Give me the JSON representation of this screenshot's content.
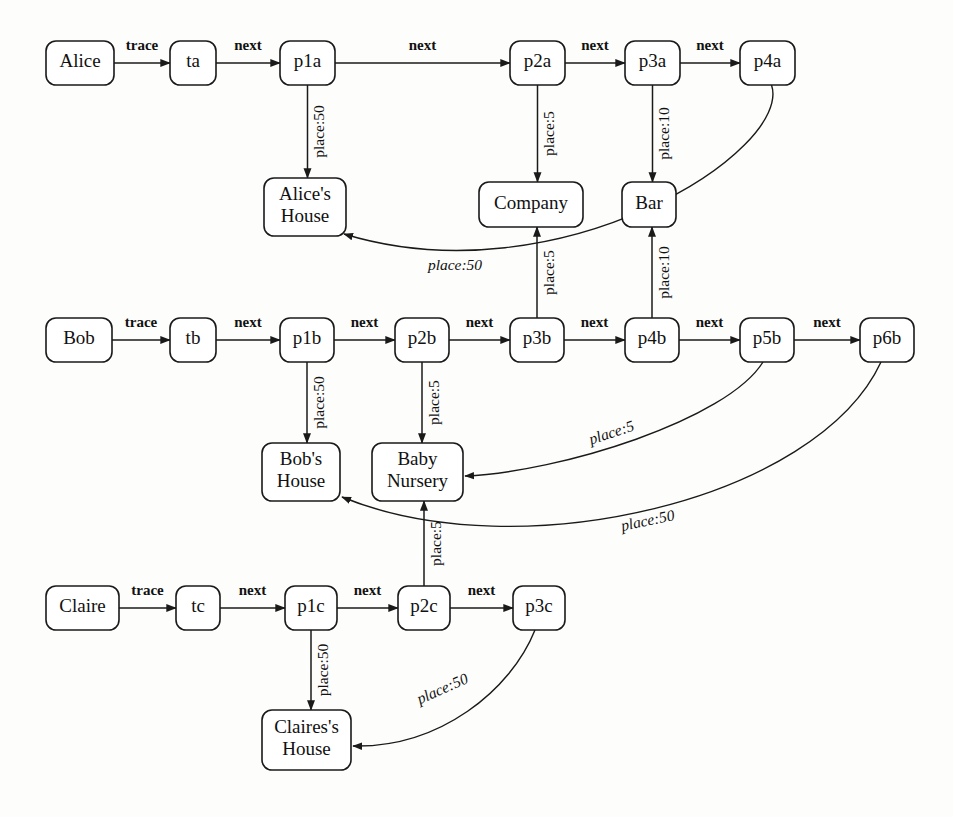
{
  "diagram": {
    "type": "directed-graph",
    "background_color": "#fdfdfb",
    "node_fill": "#ffffff",
    "stroke_color": "#1a1a1a",
    "nodes": [
      {
        "id": "alice",
        "label": "Alice",
        "x": 46,
        "y": 41,
        "w": 68,
        "h": 44,
        "lines": [
          "Alice"
        ]
      },
      {
        "id": "ta",
        "label": "ta",
        "x": 170,
        "y": 41,
        "w": 46,
        "h": 44,
        "lines": [
          "ta"
        ]
      },
      {
        "id": "p1a",
        "label": "p1a",
        "x": 280,
        "y": 41,
        "w": 55,
        "h": 44,
        "lines": [
          "p1a"
        ]
      },
      {
        "id": "p2a",
        "label": "p2a",
        "x": 510,
        "y": 41,
        "w": 55,
        "h": 44,
        "lines": [
          "p2a"
        ]
      },
      {
        "id": "p3a",
        "label": "p3a",
        "x": 625,
        "y": 41,
        "w": 55,
        "h": 44,
        "lines": [
          "p3a"
        ]
      },
      {
        "id": "p4a",
        "label": "p4a",
        "x": 740,
        "y": 41,
        "w": 55,
        "h": 44,
        "lines": [
          "p4a"
        ]
      },
      {
        "id": "alices_house",
        "label": "Alice's House",
        "x": 264,
        "y": 178,
        "w": 82,
        "h": 58,
        "lines": [
          "Alice's",
          "House"
        ]
      },
      {
        "id": "company",
        "label": "Company",
        "x": 479,
        "y": 182,
        "w": 104,
        "h": 45,
        "lines": [
          "Company"
        ]
      },
      {
        "id": "bar",
        "label": "Bar",
        "x": 622,
        "y": 182,
        "w": 54,
        "h": 45,
        "lines": [
          "Bar"
        ]
      },
      {
        "id": "bob",
        "label": "Bob",
        "x": 46,
        "y": 318,
        "w": 66,
        "h": 44,
        "lines": [
          "Bob"
        ]
      },
      {
        "id": "tb",
        "label": "tb",
        "x": 170,
        "y": 318,
        "w": 46,
        "h": 44,
        "lines": [
          "tb"
        ]
      },
      {
        "id": "p1b",
        "label": "p1b",
        "x": 280,
        "y": 318,
        "w": 54,
        "h": 44,
        "lines": [
          "p1b"
        ]
      },
      {
        "id": "p2b",
        "label": "p2b",
        "x": 395,
        "y": 318,
        "w": 54,
        "h": 44,
        "lines": [
          "p2b"
        ]
      },
      {
        "id": "p3b",
        "label": "p3b",
        "x": 510,
        "y": 318,
        "w": 54,
        "h": 44,
        "lines": [
          "p3b"
        ]
      },
      {
        "id": "p4b",
        "label": "p4b",
        "x": 625,
        "y": 318,
        "w": 54,
        "h": 44,
        "lines": [
          "p4b"
        ]
      },
      {
        "id": "p5b",
        "label": "p5b",
        "x": 740,
        "y": 318,
        "w": 54,
        "h": 44,
        "lines": [
          "p5b"
        ]
      },
      {
        "id": "p6b",
        "label": "p6b",
        "x": 860,
        "y": 318,
        "w": 54,
        "h": 44,
        "lines": [
          "p6b"
        ]
      },
      {
        "id": "bobs_house",
        "label": "Bob's House",
        "x": 262,
        "y": 443,
        "w": 78,
        "h": 58,
        "lines": [
          "Bob's",
          "House"
        ]
      },
      {
        "id": "baby_nursery",
        "label": "Baby Nursery",
        "x": 372,
        "y": 443,
        "w": 91,
        "h": 58,
        "lines": [
          "Baby",
          "Nursery"
        ]
      },
      {
        "id": "claire",
        "label": "Claire",
        "x": 46,
        "y": 586,
        "w": 73,
        "h": 44,
        "lines": [
          "Claire"
        ]
      },
      {
        "id": "tc",
        "label": "tc",
        "x": 176,
        "y": 586,
        "w": 44,
        "h": 44,
        "lines": [
          "tc"
        ]
      },
      {
        "id": "p1c",
        "label": "p1c",
        "x": 285,
        "y": 586,
        "w": 52,
        "h": 44,
        "lines": [
          "p1c"
        ]
      },
      {
        "id": "p2c",
        "label": "p2c",
        "x": 398,
        "y": 586,
        "w": 52,
        "h": 44,
        "lines": [
          "p2c"
        ]
      },
      {
        "id": "p3c",
        "label": "p3c",
        "x": 513,
        "y": 586,
        "w": 52,
        "h": 44,
        "lines": [
          "p3c"
        ]
      },
      {
        "id": "claires_house",
        "label": "Claires's House",
        "x": 262,
        "y": 710,
        "w": 89,
        "h": 60,
        "lines": [
          "Claires's",
          "House"
        ]
      }
    ],
    "edges": [
      {
        "id": "e-alice-ta",
        "from": "alice",
        "to": "ta",
        "label": "trace",
        "kind": "straight-h",
        "label_orient": "horizontal"
      },
      {
        "id": "e-ta-p1a",
        "from": "ta",
        "to": "p1a",
        "label": "next",
        "kind": "straight-h",
        "label_orient": "horizontal"
      },
      {
        "id": "e-p1a-p2a",
        "from": "p1a",
        "to": "p2a",
        "label": "next",
        "kind": "straight-h",
        "label_orient": "horizontal"
      },
      {
        "id": "e-p2a-p3a",
        "from": "p2a",
        "to": "p3a",
        "label": "next",
        "kind": "straight-h",
        "label_orient": "horizontal"
      },
      {
        "id": "e-p3a-p4a",
        "from": "p3a",
        "to": "p4a",
        "label": "next",
        "kind": "straight-h",
        "label_orient": "horizontal"
      },
      {
        "id": "e-p1a-aliceshouse",
        "from": "p1a",
        "to": "alices_house",
        "label": "place:50",
        "kind": "straight-v",
        "label_orient": "vertical"
      },
      {
        "id": "e-p2a-company",
        "from": "p2a",
        "to": "company",
        "label": "place:5",
        "kind": "straight-v",
        "label_orient": "vertical"
      },
      {
        "id": "e-p3a-bar",
        "from": "p3a",
        "to": "bar",
        "label": "place:10",
        "kind": "straight-v",
        "label_orient": "vertical"
      },
      {
        "id": "e-p4a-aliceshouse",
        "from": "p4a",
        "to": "alices_house",
        "label": "place:50",
        "kind": "curve",
        "label_orient": "rotated"
      },
      {
        "id": "e-bob-tb",
        "from": "bob",
        "to": "tb",
        "label": "trace",
        "kind": "straight-h",
        "label_orient": "horizontal"
      },
      {
        "id": "e-tb-p1b",
        "from": "tb",
        "to": "p1b",
        "label": "next",
        "kind": "straight-h",
        "label_orient": "horizontal"
      },
      {
        "id": "e-p1b-p2b",
        "from": "p1b",
        "to": "p2b",
        "label": "next",
        "kind": "straight-h",
        "label_orient": "horizontal"
      },
      {
        "id": "e-p2b-p3b",
        "from": "p2b",
        "to": "p3b",
        "label": "next",
        "kind": "straight-h",
        "label_orient": "horizontal"
      },
      {
        "id": "e-p3b-p4b",
        "from": "p3b",
        "to": "p4b",
        "label": "next",
        "kind": "straight-h",
        "label_orient": "horizontal"
      },
      {
        "id": "e-p4b-p5b",
        "from": "p4b",
        "to": "p5b",
        "label": "next",
        "kind": "straight-h",
        "label_orient": "horizontal"
      },
      {
        "id": "e-p5b-p6b",
        "from": "p5b",
        "to": "p6b",
        "label": "next",
        "kind": "straight-h",
        "label_orient": "horizontal"
      },
      {
        "id": "e-p3b-company",
        "from": "p3b",
        "to": "company",
        "label": "place:5",
        "kind": "straight-v-up",
        "label_orient": "vertical"
      },
      {
        "id": "e-p4b-bar",
        "from": "p4b",
        "to": "bar",
        "label": "place:10",
        "kind": "straight-v-up",
        "label_orient": "vertical"
      },
      {
        "id": "e-p1b-bobshouse",
        "from": "p1b",
        "to": "bobs_house",
        "label": "place:50",
        "kind": "straight-v",
        "label_orient": "vertical"
      },
      {
        "id": "e-p2b-babynursery",
        "from": "p2b",
        "to": "baby_nursery",
        "label": "place:5",
        "kind": "straight-v",
        "label_orient": "vertical"
      },
      {
        "id": "e-p5b-babynursery",
        "from": "p5b",
        "to": "baby_nursery",
        "label": "place:5",
        "kind": "curve",
        "label_orient": "rotated"
      },
      {
        "id": "e-p6b-bobshouse",
        "from": "p6b",
        "to": "bobs_house",
        "label": "place:50",
        "kind": "curve",
        "label_orient": "rotated"
      },
      {
        "id": "e-claire-tc",
        "from": "claire",
        "to": "tc",
        "label": "trace",
        "kind": "straight-h",
        "label_orient": "horizontal"
      },
      {
        "id": "e-tc-p1c",
        "from": "tc",
        "to": "p1c",
        "label": "next",
        "kind": "straight-h",
        "label_orient": "horizontal"
      },
      {
        "id": "e-p1c-p2c",
        "from": "p1c",
        "to": "p2c",
        "label": "next",
        "kind": "straight-h",
        "label_orient": "horizontal"
      },
      {
        "id": "e-p2c-p3c",
        "from": "p2c",
        "to": "p3c",
        "label": "next",
        "kind": "straight-h",
        "label_orient": "horizontal"
      },
      {
        "id": "e-p1c-claireshouse",
        "from": "p1c",
        "to": "claires_house",
        "label": "place:50",
        "kind": "straight-v",
        "label_orient": "vertical"
      },
      {
        "id": "e-p2c-babynursery",
        "from": "p2c",
        "to": "baby_nursery",
        "label": "place:5",
        "kind": "straight-v-up",
        "label_orient": "vertical"
      },
      {
        "id": "e-p3c-claireshouse",
        "from": "p3c",
        "to": "claires_house",
        "label": "place:50",
        "kind": "curve",
        "label_orient": "rotated"
      }
    ],
    "edge_labels": {
      "trace": "trace",
      "next": "next",
      "place5": "place:5",
      "place10": "place:10",
      "place50": "place:50"
    }
  }
}
